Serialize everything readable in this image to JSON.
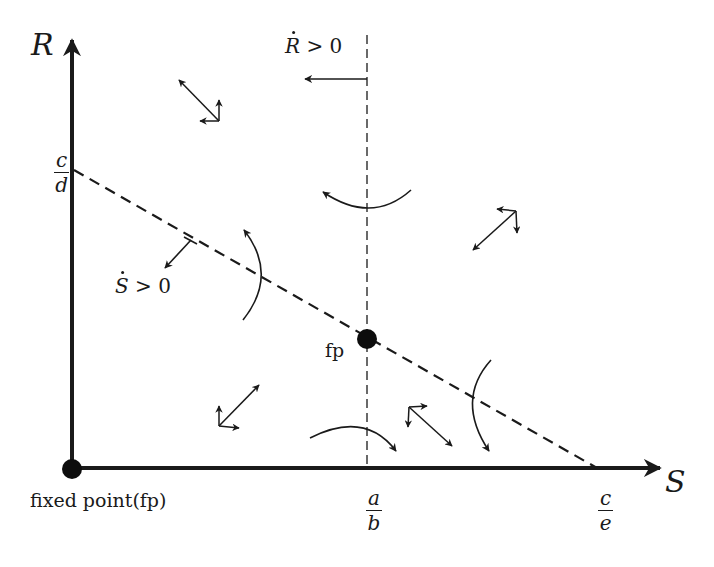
{
  "diagram": {
    "type": "phase-plane",
    "axes": {
      "vertical": {
        "label": "R"
      },
      "horizontal": {
        "label": "S"
      }
    },
    "intercepts": {
      "r_axis": {
        "numerator": "c",
        "denominator": "d"
      },
      "s_axis_vertical_nullcline": {
        "numerator": "a",
        "denominator": "b"
      },
      "s_axis_diagonal_nullcline": {
        "numerator": "c",
        "denominator": "e"
      }
    },
    "nullclines": {
      "r_dot": {
        "symbol": "R",
        "relation": "> 0",
        "style": "dashed-vertical"
      },
      "s_dot": {
        "symbol": "S",
        "relation": "> 0",
        "style": "dashed-diagonal"
      }
    },
    "fixed_points": [
      {
        "label": "fixed point(fp)",
        "position": "origin"
      },
      {
        "label": "fp",
        "position": "nullcline-intersection"
      }
    ],
    "colors": {
      "ink": "#1a1a1a",
      "background": "#ffffff"
    }
  }
}
